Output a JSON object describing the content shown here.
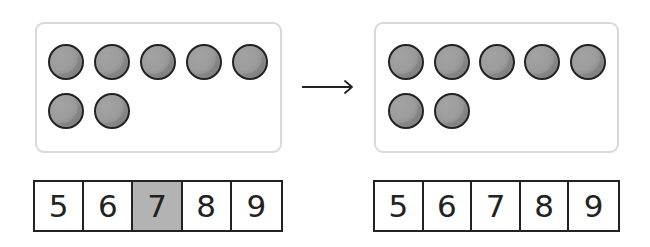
{
  "left_panel": {
    "counter_count": 7,
    "counter_rows": [
      5,
      2
    ],
    "number_strip": [
      "5",
      "6",
      "7",
      "8",
      "9"
    ],
    "highlighted_value": "7"
  },
  "transition": {
    "icon": "arrow-right-icon"
  },
  "right_panel": {
    "counter_count": 7,
    "counter_rows": [
      5,
      2
    ],
    "number_strip": [
      "5",
      "6",
      "7",
      "8",
      "9"
    ],
    "highlighted_value": null
  },
  "colors": {
    "counter_fill": "#9c9c9c",
    "counter_outline": "#222222",
    "box_border": "#d9d9d9",
    "highlight": "#b3b3b3"
  }
}
